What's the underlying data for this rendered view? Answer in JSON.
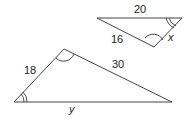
{
  "diagram": {
    "small_triangle": {
      "vertices": [
        [
          97,
          18
        ],
        [
          182,
          18
        ],
        [
          154,
          47
        ]
      ],
      "labels": {
        "top": "20",
        "left": "16",
        "right": "x"
      }
    },
    "large_triangle": {
      "vertices": [
        [
          14,
          102
        ],
        [
          64,
          49
        ],
        [
          172,
          102
        ]
      ],
      "labels": {
        "left": "18",
        "right": "30",
        "bottom": "y"
      }
    },
    "stroke_color": "#444444"
  }
}
